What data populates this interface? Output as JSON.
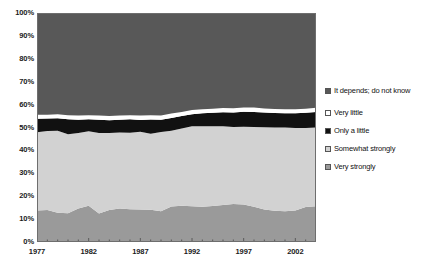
{
  "chart_data": {
    "type": "area",
    "stacked": true,
    "normalized_percent": true,
    "title": "",
    "subtitle": "",
    "xlabel": "",
    "ylabel": "",
    "xlim": [
      1977,
      2004
    ],
    "ylim": [
      0,
      100
    ],
    "grid": false,
    "legend_position": "right",
    "x": [
      1977,
      1978,
      1979,
      1980,
      1981,
      1982,
      1983,
      1984,
      1985,
      1986,
      1987,
      1988,
      1989,
      1990,
      1991,
      1992,
      1993,
      1994,
      1995,
      1996,
      1997,
      1998,
      1999,
      2000,
      2001,
      2002,
      2003,
      2004
    ],
    "x_tick_labels": [
      "1977",
      "1982",
      "1987",
      "1992",
      "1997",
      "2002"
    ],
    "x_tick_values": [
      1977,
      1982,
      1987,
      1992,
      1997,
      2002
    ],
    "y_tick_labels": [
      "0%",
      "10%",
      "20%",
      "30%",
      "40%",
      "50%",
      "60%",
      "70%",
      "80%",
      "90%",
      "100%"
    ],
    "y_tick_values": [
      0,
      10,
      20,
      30,
      40,
      50,
      60,
      70,
      80,
      90,
      100
    ],
    "series": [
      {
        "name": "Very strongly",
        "color": "#9a9a9a",
        "values": [
          13.8,
          14.0,
          12.8,
          12.6,
          14.6,
          15.8,
          12.5,
          14.0,
          14.6,
          14.3,
          14.2,
          14.1,
          13.4,
          15.5,
          15.8,
          15.6,
          15.4,
          15.7,
          16.2,
          16.6,
          16.4,
          15.4,
          14.2,
          13.6,
          13.4,
          13.8,
          15.3,
          15.6
        ]
      },
      {
        "name": "Somewhat strongly",
        "color": "#d2d2d2",
        "values": [
          34.1,
          34.5,
          35.8,
          34.4,
          33.0,
          32.6,
          35.1,
          33.6,
          33.2,
          33.4,
          33.9,
          33.2,
          34.6,
          33.1,
          33.8,
          35.0,
          35.2,
          34.8,
          34.3,
          33.6,
          33.9,
          34.8,
          35.9,
          36.4,
          36.6,
          36.0,
          34.5,
          34.4
        ]
      },
      {
        "name": "Only a little",
        "color": "#111111",
        "values": [
          5.9,
          5.4,
          5.4,
          6.6,
          5.8,
          5.2,
          5.8,
          5.6,
          5.6,
          5.9,
          5.2,
          6.2,
          5.4,
          5.6,
          5.4,
          5.2,
          5.6,
          5.9,
          6.2,
          6.4,
          6.6,
          6.6,
          6.4,
          6.3,
          6.2,
          6.4,
          6.6,
          6.8
        ]
      },
      {
        "name": "Very little",
        "color": "#ffffff",
        "values": [
          1.8,
          1.7,
          1.8,
          1.8,
          1.8,
          1.8,
          1.8,
          1.8,
          1.8,
          1.8,
          1.9,
          1.8,
          1.8,
          1.9,
          1.8,
          1.8,
          1.8,
          1.8,
          1.8,
          1.8,
          1.8,
          1.9,
          1.8,
          1.8,
          1.8,
          1.8,
          1.8,
          1.8
        ]
      },
      {
        "name": "It depends; do not know",
        "color": "#585858",
        "values": [
          44.4,
          44.4,
          44.2,
          44.6,
          44.8,
          44.6,
          44.8,
          45.0,
          44.8,
          44.6,
          44.8,
          44.7,
          44.8,
          43.9,
          43.2,
          42.4,
          42.0,
          41.8,
          41.5,
          41.6,
          41.3,
          41.3,
          41.7,
          41.9,
          42.0,
          42.0,
          41.8,
          41.4
        ]
      }
    ]
  },
  "axes": {
    "y_labels": [
      "100%",
      "90%",
      "80%",
      "70%",
      "60%",
      "50%",
      "40%",
      "30%",
      "20%",
      "10%",
      "0%"
    ],
    "x_labels": [
      "1977",
      "1982",
      "1987",
      "1992",
      "1997",
      "2002"
    ]
  },
  "legend": {
    "items": [
      {
        "label": "It depends; do not know",
        "color": "#585858"
      },
      {
        "label": "Very little",
        "color": "#ffffff"
      },
      {
        "label": "Only a little",
        "color": "#111111"
      },
      {
        "label": "Somewhat strongly",
        "color": "#d2d2d2"
      },
      {
        "label": "Very strongly",
        "color": "#9a9a9a"
      }
    ]
  },
  "style": {
    "plot_border": "#6e6e6e",
    "axis_text": "#1a1a1a",
    "background": "#ffffff"
  }
}
